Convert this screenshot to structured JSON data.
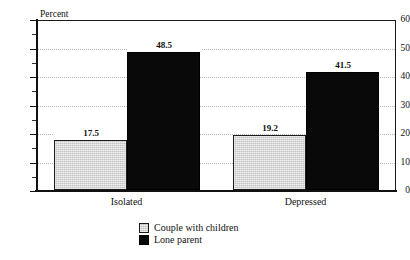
{
  "chart_data": {
    "type": "bar",
    "title": "",
    "subtitle": "",
    "xlabel": "",
    "ylabel": "Percent",
    "ylim": [
      0,
      60
    ],
    "ytick_labels": [
      "0",
      "10",
      "20",
      "30",
      "40",
      "50",
      "60"
    ],
    "ytick_values": [
      0,
      10,
      20,
      30,
      40,
      50,
      60
    ],
    "ytick_step": 10,
    "grid": "horizontal-dotted",
    "gridline_values": [
      10,
      20,
      30,
      40,
      50
    ],
    "legend_position": "bottom-center",
    "categories": [
      "Isolated",
      "Depressed"
    ],
    "series": [
      {
        "name": "Couple with children",
        "color": "#c3c3c3",
        "values": [
          17.5,
          19.2
        ],
        "value_labels": [
          "17.5",
          "19.2"
        ]
      },
      {
        "name": "Lone parent",
        "color": "#090909",
        "values": [
          48.5,
          41.5
        ],
        "value_labels": [
          "48.5",
          "41.5"
        ]
      }
    ]
  },
  "axis": {
    "y_title": "Percent"
  },
  "legend": {
    "items": [
      {
        "label": "Couple with children",
        "swatch": "gray"
      },
      {
        "label": "Lone parent",
        "swatch": "black"
      }
    ]
  }
}
